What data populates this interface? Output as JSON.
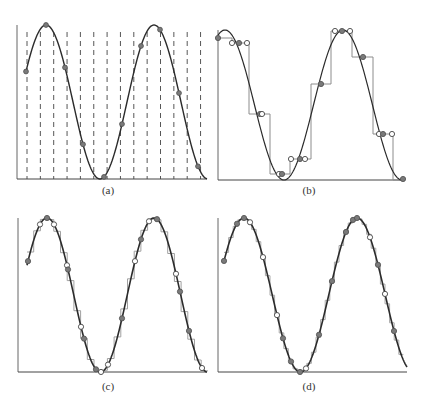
{
  "figure": {
    "colors": {
      "curve": "#2b2b2b",
      "axis": "#555555",
      "stairs": "#9a9a9a",
      "filled_marker": "#7a7a7a",
      "open_marker_stroke": "#444444",
      "dashed_grid": "#444444"
    }
  },
  "panels": [
    {
      "id": "a",
      "caption": "(a)",
      "content": "Sine curve with uniformly spaced dashed vertical sample lines and filled sample points"
    },
    {
      "id": "b",
      "caption": "(b)",
      "content": "Sine curve with coarse staircase reconstruction, filled and open circle markers"
    },
    {
      "id": "c",
      "caption": "(c)",
      "content": "Sine curve with medium staircase reconstruction, filled and open circle markers"
    },
    {
      "id": "d",
      "caption": "(d)",
      "content": "Sine curve with fine staircase reconstruction, filled and open circle markers"
    }
  ],
  "chart_data": [
    {
      "type": "line",
      "title": "(a)",
      "xlabel": "",
      "ylabel": "",
      "grid": "dashed vertical lines",
      "series": [
        {
          "name": "signal",
          "shape": "sine, ~1.75 cycles, starting near 0.75 of max, peaks at x≈0.15 and x≈0.73, trough at x≈0.44"
        }
      ],
      "samples_filled_y_normalized": [
        0.76,
        1.0,
        0.62,
        0.17,
        0.0,
        0.35,
        0.88,
        0.99,
        0.57,
        0.08
      ]
    },
    {
      "type": "line",
      "title": "(b)",
      "series": [
        {
          "name": "signal"
        },
        {
          "name": "staircase reconstruction"
        }
      ],
      "stair_levels_normalized": [
        0.9,
        0.87,
        0.42,
        0.03,
        0.13,
        0.63,
        0.97,
        0.8,
        0.3,
        0.0
      ]
    },
    {
      "type": "line",
      "title": "(c)",
      "series": [
        {
          "name": "signal"
        },
        {
          "name": "staircase reconstruction"
        }
      ]
    },
    {
      "type": "line",
      "title": "(d)",
      "series": [
        {
          "name": "signal"
        },
        {
          "name": "staircase reconstruction"
        }
      ]
    }
  ]
}
